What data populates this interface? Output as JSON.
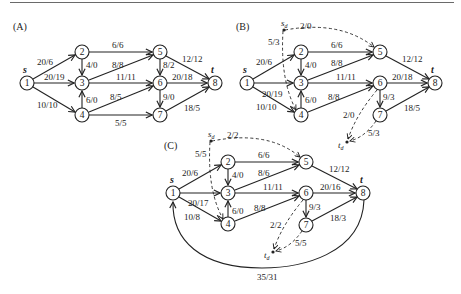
{
  "panels": [
    {
      "label": "(A)",
      "source_label": "s",
      "sink_label": "t",
      "nodes": [
        {
          "id": "1",
          "x": 27,
          "y": 83
        },
        {
          "id": "2",
          "x": 82,
          "y": 52
        },
        {
          "id": "3",
          "x": 82,
          "y": 83
        },
        {
          "id": "4",
          "x": 82,
          "y": 115
        },
        {
          "id": "5",
          "x": 160,
          "y": 52
        },
        {
          "id": "6",
          "x": 160,
          "y": 83
        },
        {
          "id": "7",
          "x": 160,
          "y": 115
        },
        {
          "id": "8",
          "x": 215,
          "y": 83
        }
      ],
      "edges": [
        {
          "from": "1",
          "to": "2",
          "label": "20/6"
        },
        {
          "from": "1",
          "to": "3",
          "label": "20/19"
        },
        {
          "from": "1",
          "to": "4",
          "label": "10/10"
        },
        {
          "from": "2",
          "to": "3",
          "label": "4/0"
        },
        {
          "from": "2",
          "to": "5",
          "label": "6/6"
        },
        {
          "from": "3",
          "to": "5",
          "label": "8/8"
        },
        {
          "from": "3",
          "to": "6",
          "label": "11/11"
        },
        {
          "from": "4",
          "to": "3",
          "label": "6/0"
        },
        {
          "from": "4",
          "to": "6",
          "label": "8/5"
        },
        {
          "from": "4",
          "to": "7",
          "label": "5/5"
        },
        {
          "from": "5",
          "to": "6",
          "label": "8/2"
        },
        {
          "from": "5",
          "to": "8",
          "label": "12/12"
        },
        {
          "from": "6",
          "to": "8",
          "label": "20/18"
        },
        {
          "from": "6",
          "to": "7",
          "label": "9/0"
        },
        {
          "from": "7",
          "to": "8",
          "label": "18/5"
        }
      ]
    },
    {
      "label": "(B)",
      "source_label": "s",
      "sink_label": "t",
      "super_source_label": "s_d",
      "super_sink_label": "t_d",
      "edges": [
        {
          "from": "1",
          "to": "2",
          "label": "20/6"
        },
        {
          "from": "1",
          "to": "3",
          "label": "20/19"
        },
        {
          "from": "1",
          "to": "4",
          "label": "10/10"
        },
        {
          "from": "2",
          "to": "3",
          "label": "4/0"
        },
        {
          "from": "2",
          "to": "5",
          "label": "6/6"
        },
        {
          "from": "3",
          "to": "5",
          "label": "8/8"
        },
        {
          "from": "3",
          "to": "6",
          "label": "11/11"
        },
        {
          "from": "4",
          "to": "3",
          "label": "6/0"
        },
        {
          "from": "4",
          "to": "6",
          "label": "8/8"
        },
        {
          "from": "5",
          "to": "8",
          "label": "12/12"
        },
        {
          "from": "6",
          "to": "8",
          "label": "20/18"
        },
        {
          "from": "6",
          "to": "7",
          "label": "9/3"
        },
        {
          "from": "7",
          "to": "8",
          "label": "18/5"
        },
        {
          "from": "s_d",
          "to": "5",
          "label": "2/0",
          "dashed": true
        },
        {
          "from": "s_d",
          "to": "4",
          "label": "5/3",
          "dashed": true
        },
        {
          "from": "6",
          "to": "t_d",
          "label": "2/0",
          "dashed": true
        },
        {
          "from": "7",
          "to": "t_d",
          "label": "5/3",
          "dashed": true
        }
      ]
    },
    {
      "label": "(C)",
      "source_label": "s",
      "sink_label": "t",
      "super_source_label": "s_d",
      "super_sink_label": "t_d",
      "edges": [
        {
          "from": "1",
          "to": "2",
          "label": "20/6"
        },
        {
          "from": "1",
          "to": "3",
          "label": "20/17"
        },
        {
          "from": "1",
          "to": "4",
          "label": "10/8"
        },
        {
          "from": "2",
          "to": "3",
          "label": "4/0"
        },
        {
          "from": "2",
          "to": "5",
          "label": "6/6"
        },
        {
          "from": "3",
          "to": "5",
          "label": "8/6"
        },
        {
          "from": "3",
          "to": "6",
          "label": "11/11"
        },
        {
          "from": "4",
          "to": "3",
          "label": "6/0"
        },
        {
          "from": "4",
          "to": "6",
          "label": "8/8"
        },
        {
          "from": "5",
          "to": "8",
          "label": "12/12"
        },
        {
          "from": "6",
          "to": "8",
          "label": "20/16"
        },
        {
          "from": "6",
          "to": "7",
          "label": "9/3"
        },
        {
          "from": "7",
          "to": "8",
          "label": "18/3"
        },
        {
          "from": "8",
          "to": "1",
          "label": "35/31"
        },
        {
          "from": "s_d",
          "to": "5",
          "label": "2/2",
          "dashed": true
        },
        {
          "from": "s_d",
          "to": "4",
          "label": "5/5",
          "dashed": true
        },
        {
          "from": "6",
          "to": "t_d",
          "label": "2/2",
          "dashed": true
        },
        {
          "from": "7",
          "to": "t_d",
          "label": "5/5",
          "dashed": true
        }
      ]
    }
  ]
}
